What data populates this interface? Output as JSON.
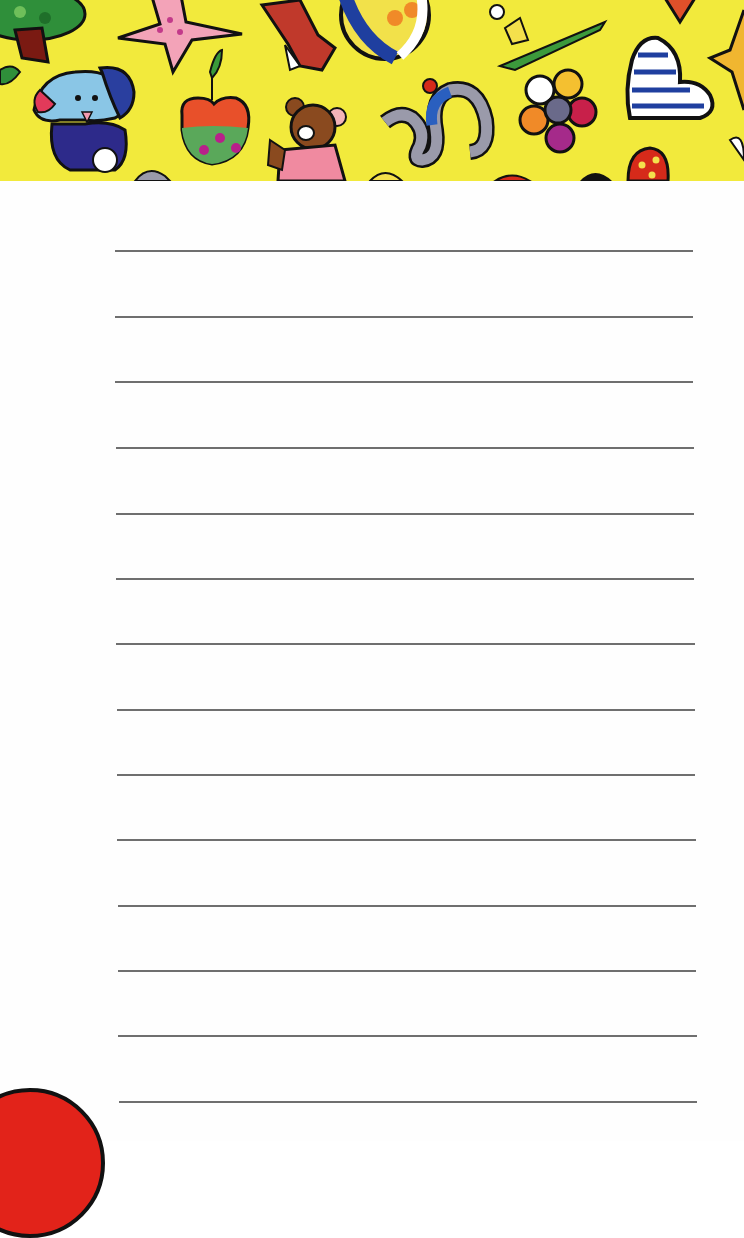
{
  "notepad": {
    "header": {
      "style": "Britto-style pop-art pattern",
      "background_color": "#f2ea3c",
      "motifs": [
        "tree-icon",
        "star-icon",
        "bird-icon",
        "ball-icon",
        "crocodile-icon",
        "heart-icon",
        "dog-icon",
        "apple-icon",
        "teddy-bear-icon",
        "snake-icon",
        "flower-icon",
        "striped-heart-icon",
        "polka-dot-heart-icon"
      ]
    },
    "page": {
      "background_color": "#fefefe",
      "line_color": "#6f6f6f",
      "line_count": 14,
      "lines": [
        {
          "y": 250,
          "x1": 115,
          "x2": 693
        },
        {
          "y": 316,
          "x1": 115,
          "x2": 693
        },
        {
          "y": 381,
          "x1": 115,
          "x2": 693
        },
        {
          "y": 447,
          "x1": 116,
          "x2": 694
        },
        {
          "y": 513,
          "x1": 116,
          "x2": 694
        },
        {
          "y": 578,
          "x1": 116,
          "x2": 694
        },
        {
          "y": 643,
          "x1": 116,
          "x2": 695
        },
        {
          "y": 709,
          "x1": 117,
          "x2": 695
        },
        {
          "y": 774,
          "x1": 117,
          "x2": 695
        },
        {
          "y": 839,
          "x1": 117,
          "x2": 696
        },
        {
          "y": 905,
          "x1": 118,
          "x2": 696
        },
        {
          "y": 970,
          "x1": 118,
          "x2": 696
        },
        {
          "y": 1035,
          "x1": 118,
          "x2": 697
        },
        {
          "y": 1101,
          "x1": 119,
          "x2": 697
        }
      ]
    },
    "corner_decoration": {
      "shape": "circle",
      "color": "#e2231a"
    }
  }
}
